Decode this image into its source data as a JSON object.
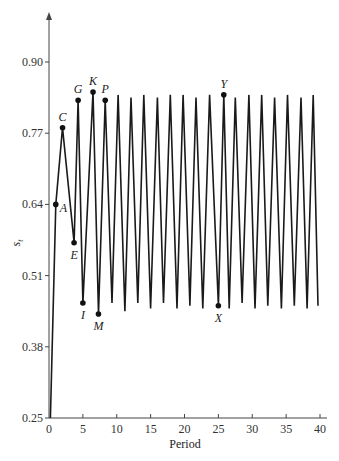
{
  "chart_data": {
    "type": "line",
    "title": "",
    "xlabel": "Period",
    "ylabel": "s_t",
    "xlim": [
      0,
      40
    ],
    "ylim": [
      0.25,
      0.9
    ],
    "grid": false,
    "legend": null,
    "x_ticks": [
      0,
      5,
      10,
      15,
      20,
      25,
      30,
      35,
      40
    ],
    "x_tick_labels": [
      "0",
      "5",
      "10",
      "15",
      "20",
      "25",
      "30",
      "35",
      "40"
    ],
    "y_ticks": [
      0.25,
      0.38,
      0.51,
      0.64,
      0.77,
      0.9
    ],
    "y_tick_labels": [
      "0.25",
      "0.38",
      "0.51",
      "0.64",
      "0.77",
      "0.90"
    ],
    "series": [
      {
        "name": "s_t",
        "color": "#1a1a1a",
        "x": [
          0.2,
          1.0,
          2.0,
          3.7,
          4.3,
          5.0,
          6.5,
          7.3,
          8.3,
          9.3,
          10.2,
          11.2,
          12.1,
          13.1,
          14.0,
          15.0,
          16.0,
          16.9,
          17.9,
          18.9,
          19.8,
          20.8,
          21.7,
          22.7,
          23.7,
          25.0,
          25.8,
          26.6,
          27.5,
          28.5,
          29.5,
          30.4,
          31.4,
          32.3,
          33.3,
          34.3,
          35.2,
          36.2,
          37.2,
          38.1,
          39.0,
          39.7
        ],
        "values": [
          0.25,
          0.64,
          0.78,
          0.57,
          0.83,
          0.46,
          0.845,
          0.44,
          0.83,
          0.46,
          0.84,
          0.445,
          0.835,
          0.46,
          0.84,
          0.45,
          0.835,
          0.46,
          0.84,
          0.45,
          0.84,
          0.455,
          0.835,
          0.45,
          0.84,
          0.455,
          0.84,
          0.45,
          0.835,
          0.46,
          0.84,
          0.45,
          0.84,
          0.455,
          0.835,
          0.45,
          0.84,
          0.455,
          0.835,
          0.45,
          0.84,
          0.455
        ]
      }
    ],
    "annotations": [
      {
        "label": "A",
        "x": 1.0,
        "y": 0.64,
        "pos": "right"
      },
      {
        "label": "C",
        "x": 2.0,
        "y": 0.78,
        "pos": "above"
      },
      {
        "label": "E",
        "x": 3.7,
        "y": 0.57,
        "pos": "below"
      },
      {
        "label": "G",
        "x": 4.3,
        "y": 0.83,
        "pos": "above"
      },
      {
        "label": "I",
        "x": 5.0,
        "y": 0.46,
        "pos": "below"
      },
      {
        "label": "K",
        "x": 6.5,
        "y": 0.845,
        "pos": "above"
      },
      {
        "label": "M",
        "x": 7.3,
        "y": 0.44,
        "pos": "below"
      },
      {
        "label": "P",
        "x": 8.3,
        "y": 0.83,
        "pos": "above"
      },
      {
        "label": "X",
        "x": 25.0,
        "y": 0.455,
        "pos": "below"
      },
      {
        "label": "Y",
        "x": 25.8,
        "y": 0.84,
        "pos": "above"
      }
    ]
  },
  "layout": {
    "plot_left": 49,
    "plot_right": 320,
    "plot_top": 62,
    "plot_bottom": 418,
    "axis_top": 12,
    "axis_right": 327
  }
}
